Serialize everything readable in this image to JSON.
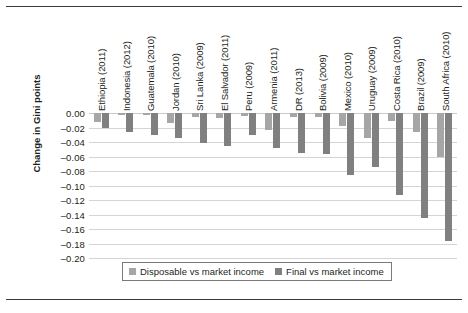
{
  "chart_data": {
    "type": "bar",
    "title": "",
    "xlabel": "",
    "ylabel": "Change in Gini points",
    "ylim": [
      -0.2,
      0.0
    ],
    "ytick_values": [
      0.0,
      -0.02,
      -0.04,
      -0.06,
      -0.08,
      -0.1,
      -0.12,
      -0.14,
      -0.16,
      -0.18,
      -0.2
    ],
    "ytick_labels": [
      "0.00",
      "–0.02",
      "–0.04",
      "–0.06",
      "–0.08",
      "–0.10",
      "–0.12",
      "–0.14",
      "–0.16",
      "–0.18",
      "–0.20"
    ],
    "grid": true,
    "legend_position": "bottom",
    "categories": [
      "Ethiopia (2011)",
      "Indonesia (2012)",
      "Guatemala (2010)",
      "Jordan (2010)",
      "Sri Lanka (2009)",
      "El Salvador (2011)",
      "Peru (2009)",
      "Armenia (2011)",
      "DR (2013)",
      "Bolivia (2009)",
      "Mexico (2010)",
      "Uruguay (2009)",
      "Costa Rica (2010)",
      "Brazil (2009)",
      "South Africa (2010)"
    ],
    "series": [
      {
        "name": "Disposable vs market income",
        "color": "#a6a6a6",
        "values": [
          -0.012,
          -0.003,
          -0.003,
          -0.014,
          -0.005,
          -0.007,
          -0.004,
          -0.023,
          -0.005,
          -0.006,
          -0.018,
          -0.034,
          -0.011,
          -0.026,
          -0.06
        ]
      },
      {
        "name": "Final vs market income",
        "color": "#808080",
        "values": [
          -0.02,
          -0.026,
          -0.031,
          -0.035,
          -0.042,
          -0.046,
          -0.03,
          -0.048,
          -0.055,
          -0.057,
          -0.085,
          -0.075,
          -0.113,
          -0.145,
          -0.176
        ]
      }
    ]
  },
  "legend": {
    "items": [
      {
        "label": "Disposable vs market income",
        "swatch": "s0"
      },
      {
        "label": "Final vs market income",
        "swatch": "s1"
      }
    ]
  },
  "colors": {
    "series_disposable": "#a6a6a6",
    "series_final": "#808080",
    "gridline": "#d4d4d4",
    "rule": "#3b3b3b",
    "text": "#231f20"
  }
}
